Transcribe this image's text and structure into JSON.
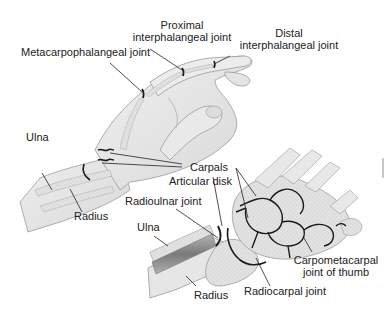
{
  "diagram": {
    "upper_view": {
      "labels": [
        {
          "id": "proximal-ip",
          "line1": "Proximal",
          "line2": "interphalangeal joint"
        },
        {
          "id": "distal-ip",
          "line1": "Distal",
          "line2": "interphalangeal joint"
        },
        {
          "id": "mcp",
          "line1": "Metacarpophalangeal joint"
        },
        {
          "id": "ulna-upper",
          "line1": "Ulna"
        },
        {
          "id": "radius-upper",
          "line1": "Radius"
        },
        {
          "id": "carpals",
          "line1": "Carpals"
        }
      ]
    },
    "lower_view": {
      "labels": [
        {
          "id": "articular-disk",
          "line1": "Articular disk"
        },
        {
          "id": "radioulnar",
          "line1": "Radioulnar joint"
        },
        {
          "id": "ulna-lower",
          "line1": "Ulna"
        },
        {
          "id": "cmc-thumb",
          "line1": "Carpometacarpal",
          "line2": "joint of thumb"
        },
        {
          "id": "radiocarpal",
          "line1": "Radiocarpal joint"
        },
        {
          "id": "radius-lower",
          "line1": "Radius"
        }
      ]
    },
    "colors": {
      "skin": "#e6e6e6",
      "bone": "#d4d4d4",
      "outline": "#9a9a9a",
      "joint": "#1a1a1a",
      "leader": "#222222"
    }
  }
}
